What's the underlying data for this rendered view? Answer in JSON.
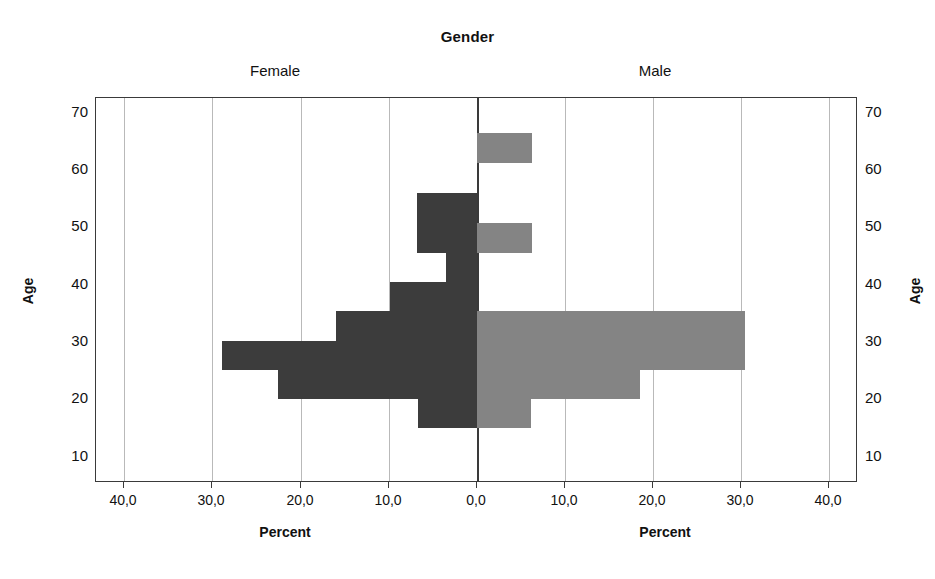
{
  "chart": {
    "title": "Gender",
    "panels": {
      "female_label": "Female",
      "male_label": "Male"
    },
    "axis": {
      "y_title_left": "Age",
      "y_title_right": "Age",
      "x_title_left": "Percent",
      "x_title_right": "Percent"
    },
    "colors": {
      "female_bar": "#3c3c3c",
      "male_bar": "#848484",
      "gridline": "#b9b9b9",
      "frame": "#3a3a3a",
      "background": "#ffffff"
    }
  },
  "chart_data": {
    "type": "bar",
    "subtype": "population-pyramid",
    "title": "Gender",
    "xlabel": "Percent",
    "ylabel": "Age",
    "grid": true,
    "legend_position": "none",
    "orientation": "horizontal",
    "categories": [
      70,
      65,
      60,
      55,
      50,
      45,
      40,
      35,
      30,
      25,
      20,
      15,
      10
    ],
    "y_tick_labels": [
      "10",
      "20",
      "30",
      "40",
      "50",
      "60",
      "70"
    ],
    "y_ticks": [
      10,
      20,
      30,
      40,
      50,
      60,
      70
    ],
    "ylim": [
      7,
      74
    ],
    "x_tick_labels_left": [
      "40,0",
      "30,0",
      "20,0",
      "10,0",
      "0,0"
    ],
    "x_tick_labels_right": [
      "0,0",
      "10,0",
      "20,0",
      "30,0",
      "40,0"
    ],
    "x_ticks": [
      40,
      30,
      20,
      10,
      0,
      10,
      20,
      30,
      40
    ],
    "xlim": [
      0,
      43.5
    ],
    "decimal_separator": ",",
    "series": [
      {
        "name": "Female",
        "side": "left",
        "color": "#3c3c3c",
        "values": [
          0.0,
          0.0,
          0.0,
          6.9,
          6.9,
          3.5,
          10.0,
          16.1,
          29.1,
          22.8,
          6.8,
          0.0,
          0.0
        ]
      },
      {
        "name": "Male",
        "side": "right",
        "color": "#848484",
        "values": [
          0.0,
          6.3,
          0.0,
          0.0,
          6.3,
          0.0,
          0.0,
          30.6,
          30.6,
          18.6,
          6.2,
          0.0,
          0.0
        ]
      }
    ],
    "bars": [
      {
        "age_group": 65,
        "female": 0.0,
        "male": 6.3
      },
      {
        "age_group": 55,
        "female": 6.9,
        "male": 0.0
      },
      {
        "age_group": 50,
        "female": 6.9,
        "male": 6.3
      },
      {
        "age_group": 45,
        "female": 3.5,
        "male": 0.0
      },
      {
        "age_group": 40,
        "female": 10.0,
        "male": 0.0
      },
      {
        "age_group": 35,
        "female": 16.1,
        "male": 30.6
      },
      {
        "age_group": 30,
        "female": 29.1,
        "male": 30.6
      },
      {
        "age_group": 25,
        "female": 22.8,
        "male": 18.6
      },
      {
        "age_group": 20,
        "female": 6.8,
        "male": 6.2
      }
    ]
  },
  "geometry": {
    "plot_left": 95,
    "plot_right": 857,
    "plot_top": 97,
    "plot_bottom": 482,
    "center_x": 476,
    "px_per_percent": 8.75,
    "rows": [
      {
        "age_group": 65,
        "top": 132,
        "height": 30
      },
      {
        "age_group": 55,
        "top": 192,
        "height": 30
      },
      {
        "age_group": 50,
        "top": 222,
        "height": 30
      },
      {
        "age_group": 45,
        "top": 252,
        "height": 29
      },
      {
        "age_group": 40,
        "top": 281,
        "height": 29
      },
      {
        "age_group": 35,
        "top": 310,
        "height": 30
      },
      {
        "age_group": 30,
        "top": 340,
        "height": 29
      },
      {
        "age_group": 25,
        "top": 369,
        "height": 29
      },
      {
        "age_group": 20,
        "top": 398,
        "height": 29
      }
    ],
    "ytick_px": [
      {
        "label": "70",
        "top": 103
      },
      {
        "label": "60",
        "top": 160
      },
      {
        "label": "50",
        "top": 217
      },
      {
        "label": "40",
        "top": 275
      },
      {
        "label": "30",
        "top": 332
      },
      {
        "label": "20",
        "top": 389
      },
      {
        "label": "10",
        "top": 447
      }
    ],
    "xtick_px": [
      {
        "label": "40,0",
        "x": 123
      },
      {
        "label": "30,0",
        "x": 211
      },
      {
        "label": "20,0",
        "x": 300
      },
      {
        "label": "10,0",
        "x": 388
      },
      {
        "label": "0,0",
        "x": 476
      },
      {
        "label": "10,0",
        "x": 564
      },
      {
        "label": "20,0",
        "x": 652
      },
      {
        "label": "30,0",
        "x": 740
      },
      {
        "label": "40,0",
        "x": 828
      }
    ]
  }
}
